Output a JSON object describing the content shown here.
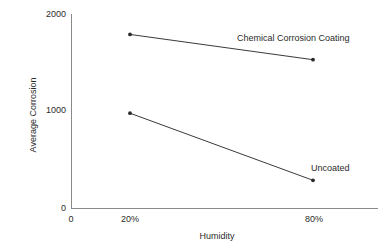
{
  "chart_data": {
    "type": "line",
    "title": "",
    "xlabel": "Humidity",
    "ylabel": "Average Corrosion",
    "categories": [
      "20%",
      "80%"
    ],
    "x": [
      20,
      80
    ],
    "xlim": [
      0,
      100
    ],
    "ylim": [
      0,
      2000
    ],
    "grid": false,
    "legend_position": "inline-annotation",
    "yticks": [
      {
        "value": 0,
        "label": "0"
      },
      {
        "value": 1000,
        "label": "1000"
      },
      {
        "value": 2000,
        "label": "2000"
      }
    ],
    "xticks": [
      {
        "value": 0,
        "label": "0"
      },
      {
        "value": 20,
        "label": "20%"
      },
      {
        "value": 80,
        "label": "80%"
      }
    ],
    "series": [
      {
        "name": "Chemical Corrosion Coating",
        "values": [
          1790,
          1530
        ],
        "annotation": "Chemical Corrosion Coating"
      },
      {
        "name": "Uncoated",
        "values": [
          980,
          290
        ],
        "annotation": "Uncoated"
      }
    ]
  },
  "axes": {
    "y_title": "Average Corrosion",
    "x_title": "Humidity",
    "y_tick_0": "0",
    "y_tick_1000": "1000",
    "y_tick_2000": "2000",
    "x_tick_origin": "0",
    "x_tick_20": "20%",
    "x_tick_80": "80%"
  },
  "annotations": {
    "coated": "Chemical Corrosion Coating",
    "uncoated": "Uncoated"
  },
  "colors": {
    "axis": "#8a8a8a",
    "line": "#3a3a3a",
    "text": "#2b2b2b",
    "background": "#ffffff"
  }
}
